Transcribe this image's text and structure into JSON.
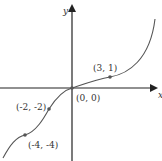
{
  "diagram": {
    "type": "function-graph",
    "axes": {
      "x_label": "x",
      "y_label": "y"
    },
    "points": [
      {
        "label": "(3, 1)",
        "x": 3,
        "y": 1
      },
      {
        "label": "(0, 0)",
        "x": 0,
        "y": 0
      },
      {
        "label": "(-2, -2)",
        "x": -2,
        "y": -2
      },
      {
        "label": "(-4, -4)",
        "x": -4,
        "y": -4
      }
    ],
    "colors": {
      "curve": "#555555",
      "axes": "#222222",
      "point": "#555555"
    }
  }
}
